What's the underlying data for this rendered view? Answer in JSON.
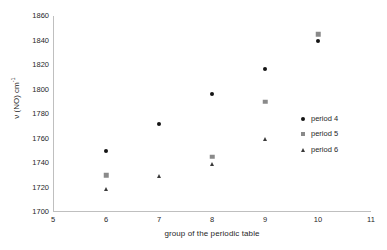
{
  "chart_data": {
    "type": "scatter",
    "title": "",
    "xlabel": "group of the periodic table",
    "ylabel": "ν (NO) cm",
    "ylabel_exponent": "-1",
    "xlim": [
      5,
      11
    ],
    "ylim": [
      1700,
      1860
    ],
    "xticks": [
      5,
      6,
      7,
      8,
      9,
      10,
      11
    ],
    "yticks": [
      1700,
      1720,
      1740,
      1760,
      1780,
      1800,
      1820,
      1840,
      1860
    ],
    "grid": false,
    "legend_position": "right",
    "series": [
      {
        "name": "period 4",
        "marker": "diamond",
        "color": "#141414",
        "points": [
          {
            "x": 6,
            "y": 1750
          },
          {
            "x": 7,
            "y": 1772
          },
          {
            "x": 8,
            "y": 1796
          },
          {
            "x": 9,
            "y": 1817
          },
          {
            "x": 10,
            "y": 1840
          }
        ]
      },
      {
        "name": "period 5",
        "marker": "square",
        "color": "#8a8a8a",
        "points": [
          {
            "x": 6,
            "y": 1730
          },
          {
            "x": 8,
            "y": 1745
          },
          {
            "x": 9,
            "y": 1790
          },
          {
            "x": 10,
            "y": 1845
          }
        ]
      },
      {
        "name": "period 6",
        "marker": "triangle",
        "color": "#3a3a3a",
        "points": [
          {
            "x": 6,
            "y": 1719
          },
          {
            "x": 7,
            "y": 1729
          },
          {
            "x": 8,
            "y": 1739
          },
          {
            "x": 9,
            "y": 1760
          }
        ]
      }
    ]
  },
  "legend": {
    "items": [
      {
        "label": "period 4"
      },
      {
        "label": "period 5"
      },
      {
        "label": "period 6"
      }
    ]
  }
}
